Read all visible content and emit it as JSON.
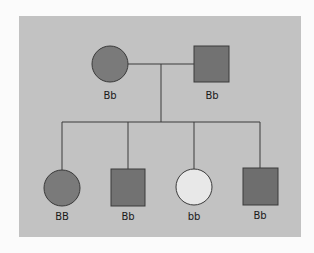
{
  "diagram": {
    "type": "pedigree",
    "colors": {
      "background": "#fbfbfb",
      "panel": "#c2c2c2",
      "affected_fill": "#7a7a7a",
      "unaffected_fill": "#e8e8e8",
      "stroke": "#3a3a3a"
    },
    "generation_1": [
      {
        "id": "mother",
        "sex": "female",
        "shape": "circle",
        "affected": true,
        "genotype": "Bb"
      },
      {
        "id": "father",
        "sex": "male",
        "shape": "square",
        "affected": true,
        "genotype": "Bb"
      }
    ],
    "generation_2": [
      {
        "id": "child1",
        "sex": "female",
        "shape": "circle",
        "affected": true,
        "genotype": "BB"
      },
      {
        "id": "child2",
        "sex": "male",
        "shape": "square",
        "affected": true,
        "genotype": "Bb"
      },
      {
        "id": "child3",
        "sex": "female",
        "shape": "circle",
        "affected": false,
        "genotype": "bb"
      },
      {
        "id": "child4",
        "sex": "male",
        "shape": "square",
        "affected": true,
        "genotype": "Bb"
      }
    ]
  }
}
